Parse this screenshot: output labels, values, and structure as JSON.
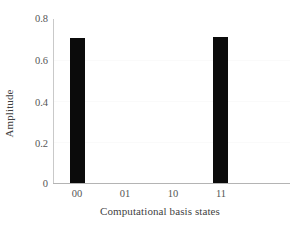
{
  "chart_data": {
    "type": "bar",
    "title": "",
    "xlabel": "Computational basis states",
    "ylabel": "Amplitude",
    "categories": [
      "00",
      "01",
      "10",
      "11"
    ],
    "values": [
      0.707,
      0.0,
      0.0,
      0.712
    ],
    "ylim": [
      0,
      0.8
    ],
    "yticks": [
      0,
      0.2,
      0.4,
      0.6,
      0.8
    ],
    "ytick_labels": [
      "0",
      "0.2",
      "0.4",
      "0.6",
      "0.8"
    ],
    "xtick_labels": [
      "00",
      "01",
      "10",
      "11"
    ],
    "grid": "faint-horizontal",
    "legend": "none",
    "bar_color": "#0b0b0b",
    "axis_color": "#b4b4b4",
    "background_color": "#ffffff",
    "bar_width_fraction": 0.31
  }
}
